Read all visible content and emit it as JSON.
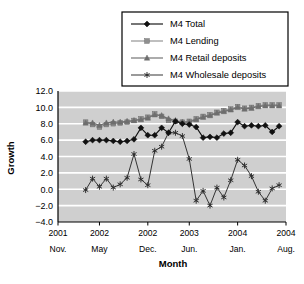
{
  "chart_data": {
    "type": "line",
    "title": "",
    "xlabel": "Month",
    "ylabel": "Growth",
    "ylim": [
      -4.0,
      12.0
    ],
    "ytick_labels": [
      "12.0",
      "10.0",
      "8.0",
      "6.0",
      "4.0",
      "2.0",
      "0.0",
      "-2.0",
      "-4.0"
    ],
    "ytick_values": [
      12.0,
      10.0,
      8.0,
      6.0,
      4.0,
      2.0,
      0.0,
      -2.0,
      -4.0
    ],
    "grid": true,
    "grid_axis": "y",
    "plot_background": "#cfcfcf",
    "gridline_color": "#ffffff",
    "legend_position": "top-right",
    "xtick_labels": [
      {
        "year": "2001",
        "month": "Nov."
      },
      {
        "year": "2002",
        "month": "May"
      },
      {
        "year": "2002",
        "month": "Dec."
      },
      {
        "year": "2003",
        "month": "Jun."
      },
      {
        "year": "2004",
        "month": "Jan."
      },
      {
        "year": "2004",
        "month": "Aug."
      }
    ],
    "xtick_positions": [
      0,
      6,
      13,
      19,
      26,
      33
    ],
    "x_range": [
      0,
      33
    ],
    "series": [
      {
        "name": "M4 Total",
        "marker": "diamond",
        "color": "#111111",
        "x": [
          4,
          5,
          6,
          7,
          8,
          9,
          10,
          11,
          12,
          13,
          14,
          15,
          16,
          17,
          18,
          19,
          20,
          21,
          22,
          23,
          24,
          25,
          26,
          27,
          28,
          29,
          30,
          31,
          32
        ],
        "values": [
          5.8,
          6.0,
          6.0,
          6.0,
          5.9,
          5.8,
          5.9,
          6.1,
          7.5,
          6.6,
          6.6,
          7.5,
          6.9,
          8.3,
          8.0,
          7.9,
          7.6,
          6.3,
          6.4,
          6.3,
          6.8,
          6.9,
          8.2,
          7.7,
          7.8,
          7.7,
          7.8,
          7.0,
          7.7
        ]
      },
      {
        "name": "M4 Lending",
        "marker": "square",
        "color": "#8f8f8f",
        "x": [
          4,
          5,
          6,
          7,
          8,
          9,
          10,
          11,
          12,
          13,
          14,
          15,
          16,
          17,
          18,
          19,
          20,
          21,
          22,
          23,
          24,
          25,
          26,
          27,
          28,
          29,
          30,
          31,
          32
        ],
        "values": [
          8.2,
          7.9,
          7.6,
          7.9,
          8.0,
          8.1,
          8.2,
          8.4,
          8.6,
          8.8,
          9.2,
          8.9,
          8.4,
          8.3,
          8.2,
          8.3,
          8.6,
          8.9,
          9.1,
          9.4,
          9.6,
          9.8,
          10.1,
          9.9,
          10.0,
          10.2,
          10.3,
          10.3,
          10.3
        ]
      },
      {
        "name": "M4 Retail deposits",
        "marker": "triangle",
        "color": "#6e6e6e",
        "x": [
          4,
          5,
          6,
          7,
          8,
          9,
          10,
          11,
          12,
          13,
          14,
          15,
          16,
          17,
          18,
          19,
          20,
          21,
          22,
          23,
          24,
          25,
          26,
          27,
          28,
          29,
          30,
          31,
          32
        ],
        "values": [
          8.1,
          8.1,
          7.8,
          8.1,
          8.2,
          8.2,
          8.3,
          8.4,
          8.5,
          8.7,
          9.1,
          9.0,
          8.6,
          8.4,
          8.2,
          8.2,
          8.5,
          8.8,
          9.0,
          9.3,
          9.5,
          9.7,
          10.0,
          9.8,
          9.9,
          10.1,
          10.2,
          10.2,
          10.2
        ]
      },
      {
        "name": "M4 Wholesale deposits",
        "marker": "star",
        "color": "#2b2b2b",
        "x": [
          4,
          5,
          6,
          7,
          8,
          9,
          10,
          11,
          12,
          13,
          14,
          15,
          16,
          17,
          18,
          19,
          20,
          21,
          22,
          23,
          24,
          25,
          26,
          27,
          28,
          29,
          30,
          31,
          32
        ],
        "values": [
          -0.1,
          1.3,
          0.3,
          1.3,
          0.2,
          0.6,
          1.4,
          4.3,
          1.2,
          0.5,
          4.7,
          5.2,
          6.9,
          6.9,
          6.5,
          3.7,
          -1.4,
          -0.2,
          -2.0,
          0.2,
          -1.0,
          1.1,
          3.6,
          2.9,
          1.6,
          -0.3,
          -1.4,
          0.1,
          0.5
        ]
      }
    ]
  },
  "legend": {
    "items": [
      {
        "label": "M4 Total"
      },
      {
        "label": "M4 Lending"
      },
      {
        "label": "M4 Retail deposits"
      },
      {
        "label": "M4 Wholesale deposits"
      }
    ]
  },
  "axes": {
    "y_title": "Growth",
    "x_title": "Month"
  }
}
